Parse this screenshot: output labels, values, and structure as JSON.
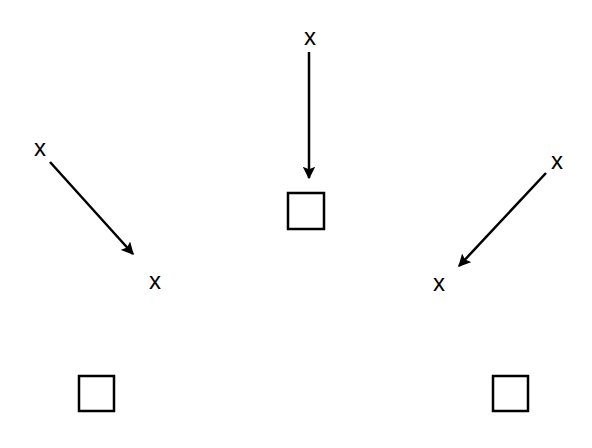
{
  "diagram": {
    "stroke_color": "#000000",
    "background": "#ffffff",
    "markers": [
      {
        "id": "x-top",
        "label": "x",
        "x": 310,
        "y": 37
      },
      {
        "id": "x-left-start",
        "label": "x",
        "x": 40,
        "y": 148
      },
      {
        "id": "x-left-end",
        "label": "x",
        "x": 155,
        "y": 281
      },
      {
        "id": "x-right-start",
        "label": "x",
        "x": 557,
        "y": 161
      },
      {
        "id": "x-right-end",
        "label": "x",
        "x": 439,
        "y": 283
      }
    ],
    "squares": [
      {
        "id": "square-center",
        "x": 288,
        "y": 193,
        "size": 36
      },
      {
        "id": "square-bottom-left",
        "x": 79,
        "y": 376,
        "size": 35
      },
      {
        "id": "square-bottom-right",
        "x": 493,
        "y": 376,
        "size": 35
      }
    ],
    "arrows": [
      {
        "id": "arrow-top",
        "x1": 309,
        "y1": 52,
        "x2": 309,
        "y2": 178
      },
      {
        "id": "arrow-left",
        "x1": 50,
        "y1": 162,
        "x2": 133,
        "y2": 254
      },
      {
        "id": "arrow-right",
        "x1": 546,
        "y1": 173,
        "x2": 459,
        "y2": 266
      }
    ]
  }
}
